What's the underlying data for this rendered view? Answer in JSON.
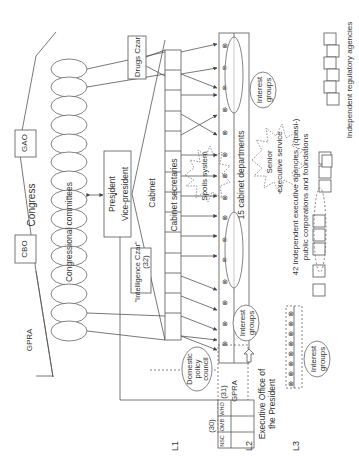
{
  "diagram": {
    "orientation": "rotated-90-ccw",
    "levels": [
      "L1",
      "L2",
      "L3"
    ],
    "congress": {
      "label": "Congress",
      "cbo": "CBO",
      "gao": "GAO",
      "gpra": "GPRA",
      "committees": "Congressional committees"
    },
    "executive": {
      "president": "President",
      "vice_president": "Vice-president",
      "cabinet": "Cabinet",
      "cabinet_secretaries": "Cabinet secretaries",
      "intelligence_czar": "\"Intelligence Czar\"",
      "intelligence_count": "(32)",
      "drugs_czar": "Drugs Czar",
      "spoils_system": "Spoils system",
      "senior_executive_service": "Senior executive service",
      "cabinet_departments": "15 cabinet departments"
    },
    "eop": {
      "label": "Executive Office of the President",
      "units": [
        "NSC",
        "OMB",
        "WHO"
      ],
      "count_30": "(30)",
      "count_31": "(31)",
      "gpra": "GPRA",
      "domestic_policy_council": "Domestic policy council"
    },
    "interest_groups": "Interest groups",
    "agencies": {
      "independent_executive": "42 independent executive agencies, (quasi-) public corporations and foundations",
      "independent_regulatory": "Independent regulatory agencies"
    }
  }
}
